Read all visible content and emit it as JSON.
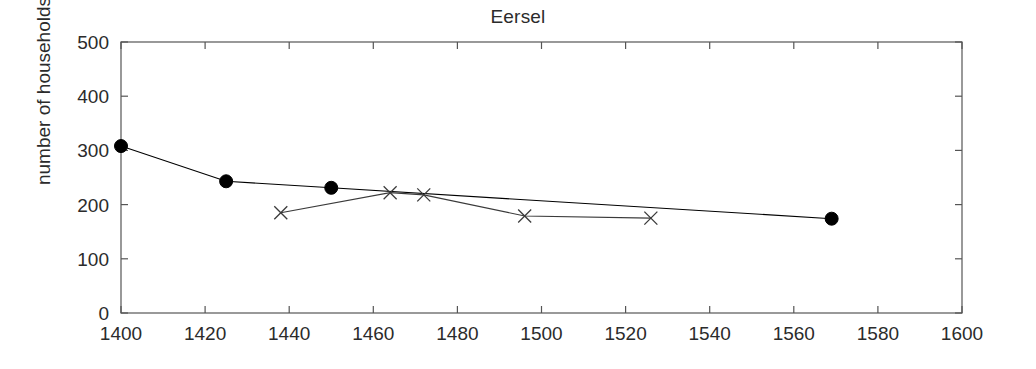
{
  "chart_data": {
    "type": "line",
    "title": "Eersel",
    "xlabel": "",
    "ylabel": "number of households",
    "xlim": [
      1400,
      1600
    ],
    "ylim": [
      0,
      500
    ],
    "xticks": [
      1400,
      1420,
      1440,
      1460,
      1480,
      1500,
      1520,
      1540,
      1560,
      1580,
      1600
    ],
    "yticks": [
      0,
      100,
      200,
      300,
      400,
      500
    ],
    "grid": false,
    "legend": "none",
    "series": [
      {
        "name": "filled-circle-series",
        "marker": "filled-circle",
        "color": "#000000",
        "points": [
          {
            "x": 1400,
            "y": 308
          },
          {
            "x": 1425,
            "y": 243
          },
          {
            "x": 1450,
            "y": 231
          },
          {
            "x": 1569,
            "y": 174
          }
        ]
      },
      {
        "name": "cross-series",
        "marker": "x-cross",
        "color": "#3a3a3a",
        "points": [
          {
            "x": 1438,
            "y": 185
          },
          {
            "x": 1464,
            "y": 222
          },
          {
            "x": 1472,
            "y": 218
          },
          {
            "x": 1496,
            "y": 179
          },
          {
            "x": 1526,
            "y": 175
          }
        ]
      }
    ]
  }
}
